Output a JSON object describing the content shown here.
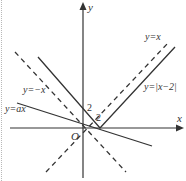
{
  "diagram": {
    "type": "function-graph",
    "axes": {
      "x_label": "x",
      "y_label": "y",
      "origin_label": "O"
    },
    "tick_labels": {
      "y_axis": "2",
      "x_axis": "2"
    },
    "curves": [
      {
        "id": "y_eq_x",
        "label": "y=x",
        "style": "dashed"
      },
      {
        "id": "y_eq_neg_x",
        "label": "y=−x",
        "style": "dashed"
      },
      {
        "id": "y_eq_abs_x_minus_2",
        "label": "y=|x−2|",
        "style": "solid"
      },
      {
        "id": "y_eq_ax",
        "label": "y=ax",
        "style": "solid"
      }
    ],
    "colors": {
      "line": "#333333",
      "background": "#ffffff",
      "frame": "#b8b8b8"
    }
  }
}
